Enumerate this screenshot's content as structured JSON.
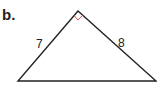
{
  "part_label": "b.",
  "triangle": {
    "type": "right triangle",
    "right_angle_at": "apex",
    "sides": {
      "left_leg": "7",
      "right_leg": "8"
    },
    "right_angle_marker_color": "#d9534f",
    "stroke_color": "#222222"
  }
}
